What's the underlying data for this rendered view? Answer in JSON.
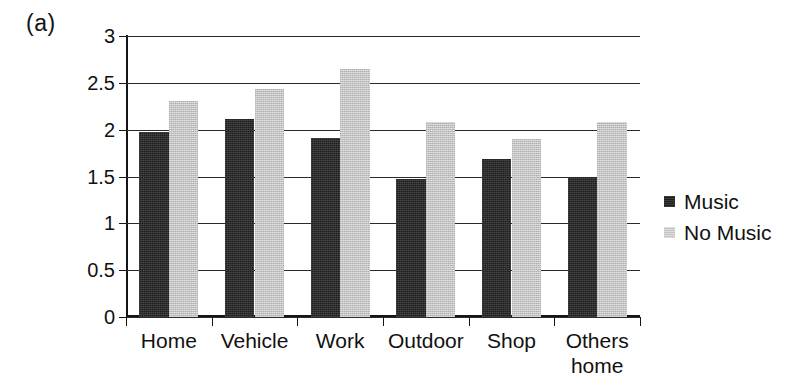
{
  "panel": {
    "label": "(a)"
  },
  "chart_data": {
    "type": "bar",
    "title": "",
    "subtitle": "",
    "xlabel": "",
    "ylabel": "",
    "categories": [
      "Home",
      "Vehicle",
      "Work",
      "Outdoor",
      "Shop",
      "Others home"
    ],
    "category_lines": [
      [
        "Home"
      ],
      [
        "Vehicle"
      ],
      [
        "Work"
      ],
      [
        "Outdoor"
      ],
      [
        "Shop"
      ],
      [
        "Others",
        "home"
      ]
    ],
    "series": [
      {
        "name": "Music",
        "color": "#1f1f1f",
        "values": [
          1.97,
          2.11,
          1.91,
          1.47,
          1.69,
          1.49
        ]
      },
      {
        "name": "No Music",
        "color": "#c3c3c3",
        "values": [
          2.31,
          2.43,
          2.65,
          2.08,
          1.9,
          2.08
        ]
      }
    ],
    "ylim": [
      0,
      3
    ],
    "yticks": [
      0,
      0.5,
      1,
      1.5,
      2,
      2.5,
      3
    ],
    "ytick_labels": [
      "0",
      "0.5",
      "1",
      "1.5",
      "2",
      "2.5",
      "3"
    ],
    "grid": true,
    "grid_axis": "y",
    "legend_position": "right"
  },
  "legend": {
    "entries": [
      {
        "label": "Music",
        "swatch": "music"
      },
      {
        "label": "No Music",
        "swatch": "nomusic"
      }
    ]
  }
}
